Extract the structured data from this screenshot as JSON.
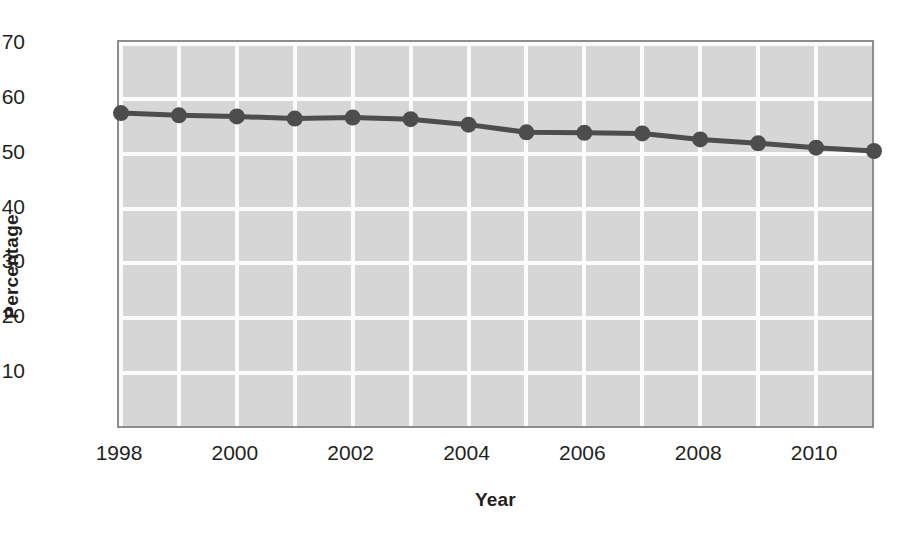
{
  "chart_data": {
    "type": "line",
    "title": "",
    "xlabel": "Year",
    "ylabel": "Percentage",
    "x": [
      1998,
      1999,
      2000,
      2001,
      2002,
      2003,
      2004,
      2005,
      2006,
      2007,
      2008,
      2009,
      2010,
      2011
    ],
    "values": [
      57.4,
      57.0,
      56.8,
      56.4,
      56.6,
      56.3,
      55.3,
      53.9,
      53.8,
      53.7,
      52.6,
      51.9,
      51.1,
      50.5
    ],
    "series": [
      {
        "name": "Percentage",
        "values": [
          57.4,
          57.0,
          56.8,
          56.4,
          56.6,
          56.3,
          55.3,
          53.9,
          53.8,
          53.7,
          52.6,
          51.9,
          51.1,
          50.5
        ]
      }
    ],
    "xlim": [
      1998,
      2011
    ],
    "ylim": [
      0,
      70
    ],
    "yticks": [
      10,
      20,
      30,
      40,
      50,
      60,
      70
    ],
    "ytick_labels": [
      "10",
      "20",
      "30",
      "40",
      "50",
      "60",
      "70"
    ],
    "xticks": [
      1998,
      2000,
      2002,
      2004,
      2006,
      2008,
      2010
    ],
    "xtick_labels": [
      "1998",
      "2000",
      "2002",
      "2004",
      "2006",
      "2008",
      "2010"
    ],
    "grid": true,
    "grid_color": "#fbfbfb",
    "plot_background": "#d6d6d6",
    "line_color": "#4d4d4d",
    "marker": "circle",
    "marker_color": "#4d4d4d",
    "legend": "none"
  }
}
